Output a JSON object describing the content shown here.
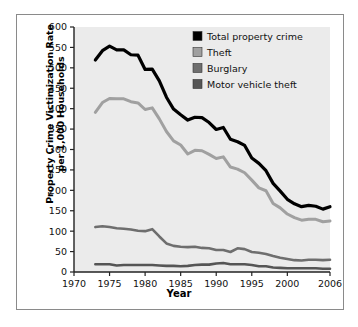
{
  "chart_data": {
    "type": "line",
    "title": "",
    "xlabel": "Year",
    "ylabel": "Property Crime Victimization Rate per 1,000 Households",
    "ylabel_line1": "Property Crime Victimization Rate",
    "ylabel_line2": "per 1,000 Households",
    "xlim": [
      1970,
      2006
    ],
    "ylim": [
      0,
      600
    ],
    "ytick_labels": [
      "600",
      "550",
      "500",
      "450",
      "400",
      "350",
      "300",
      "250",
      "200",
      "150",
      "100",
      "50",
      "0"
    ],
    "yticks": [
      600,
      550,
      500,
      450,
      400,
      350,
      300,
      250,
      200,
      150,
      100,
      50,
      0
    ],
    "xtick_labels": [
      "1970",
      "1975",
      "1980",
      "1985",
      "1990",
      "1995",
      "2000",
      "2006"
    ],
    "xticks": [
      1970,
      1975,
      1980,
      1985,
      1990,
      1995,
      2000,
      2006
    ],
    "grid": false,
    "legend_position": "top-right",
    "plot_background": "#ebebeb",
    "x": [
      1973,
      1974,
      1975,
      1976,
      1977,
      1978,
      1979,
      1980,
      1981,
      1982,
      1983,
      1984,
      1985,
      1986,
      1987,
      1988,
      1989,
      1990,
      1991,
      1992,
      1993,
      1994,
      1995,
      1996,
      1997,
      1998,
      1999,
      2000,
      2001,
      2002,
      2003,
      2004,
      2005,
      2006
    ],
    "series": [
      {
        "name": "Total property crime",
        "color": "#000000",
        "width": 3.2,
        "values": [
          519,
          542,
          553,
          544,
          544,
          532,
          531,
          496,
          497,
          468,
          428,
          399,
          385,
          372,
          379,
          378,
          366,
          349,
          354,
          325,
          319,
          310,
          279,
          266,
          248,
          217,
          198,
          178,
          167,
          160,
          163,
          161,
          154,
          160
        ]
      },
      {
        "name": "Theft",
        "color": "#a0a0a0",
        "width": 3.0,
        "values": [
          391,
          415,
          425,
          424,
          424,
          417,
          414,
          398,
          402,
          375,
          344,
          321,
          311,
          289,
          298,
          297,
          288,
          278,
          282,
          257,
          252,
          243,
          225,
          206,
          199,
          168,
          157,
          142,
          133,
          127,
          129,
          129,
          123,
          125
        ]
      },
      {
        "name": "Burglary",
        "color": "#6e6e6e",
        "width": 2.6,
        "values": [
          110,
          112,
          110,
          107,
          106,
          104,
          101,
          100,
          105,
          87,
          70,
          64,
          62,
          61,
          62,
          59,
          58,
          54,
          54,
          49,
          58,
          56,
          49,
          47,
          44,
          39,
          35,
          32,
          29,
          28,
          30,
          30,
          29,
          30
        ]
      },
      {
        "name": "Motor vehicle theft",
        "color": "#555555",
        "width": 2.6,
        "values": [
          19,
          19,
          19,
          16,
          17,
          17,
          17,
          17,
          17,
          16,
          15,
          15,
          14,
          15,
          17,
          18,
          18,
          21,
          22,
          19,
          19,
          19,
          17,
          14,
          14,
          11,
          10,
          9,
          9,
          9,
          9,
          9,
          8,
          8
        ]
      }
    ],
    "legend": [
      {
        "label": "Total property crime",
        "color": "#000000"
      },
      {
        "label": "Theft",
        "color": "#a0a0a0"
      },
      {
        "label": "Burglary",
        "color": "#6e6e6e"
      },
      {
        "label": "Motor vehicle theft",
        "color": "#555555"
      }
    ]
  }
}
